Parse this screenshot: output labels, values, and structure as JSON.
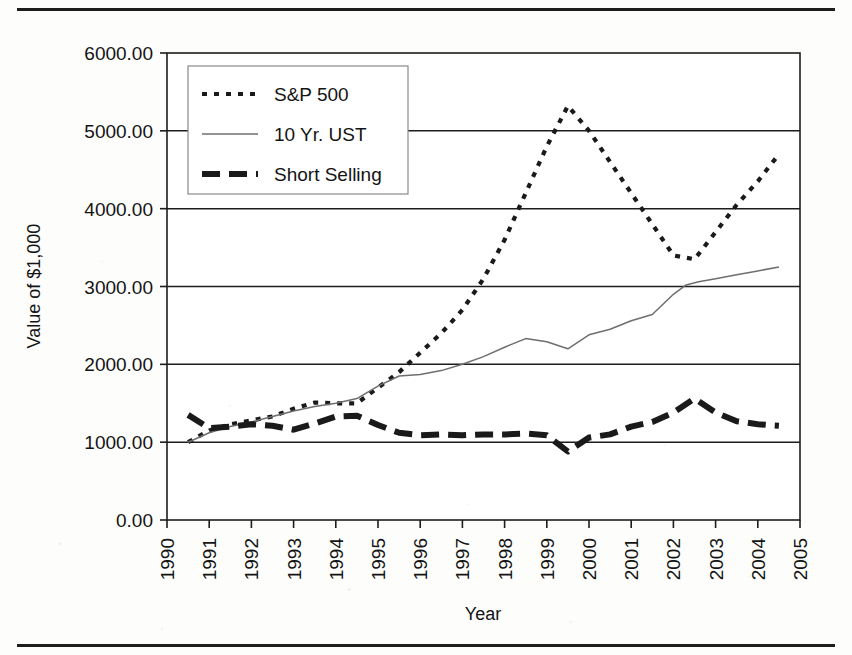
{
  "figure": {
    "top_rule": "horizontal-rule",
    "bottom_rule": "horizontal-rule"
  },
  "chart_data": {
    "type": "line",
    "title": "",
    "xlabel": "Year",
    "ylabel": "Value of $1,000",
    "xlim": [
      1990,
      2005
    ],
    "ylim": [
      0,
      6000
    ],
    "grid": "horizontal",
    "legend_position": "top-left",
    "xticks": [
      "1990",
      "1991",
      "1992",
      "1993",
      "1994",
      "1995",
      "1996",
      "1997",
      "1998",
      "1999",
      "2000",
      "2001",
      "2002",
      "2003",
      "2004",
      "2005"
    ],
    "yticks": [
      "0.00",
      "1000.00",
      "2000.00",
      "3000.00",
      "4000.00",
      "5000.00",
      "6000.00"
    ],
    "series": [
      {
        "name": "S&P 500",
        "style": "fine-dashed",
        "color": "#1a1a1a",
        "x": [
          1990.5,
          1991.0,
          1991.5,
          1992.0,
          1992.5,
          1993.0,
          1993.5,
          1994.0,
          1994.5,
          1995.0,
          1995.5,
          1996.0,
          1996.5,
          1997.0,
          1997.5,
          1998.0,
          1998.5,
          1999.0,
          1999.5,
          2000.0,
          2000.5,
          2001.0,
          2001.5,
          2002.0,
          2002.5,
          2003.0,
          2003.5,
          2004.0,
          2004.5
        ],
        "values": [
          1000,
          1150,
          1230,
          1280,
          1330,
          1430,
          1510,
          1500,
          1500,
          1700,
          1900,
          2150,
          2400,
          2700,
          3100,
          3600,
          4200,
          4800,
          5320,
          5000,
          4600,
          4200,
          3800,
          3400,
          3350,
          3700,
          4050,
          4350,
          4700
        ]
      },
      {
        "name": "10 Yr. UST",
        "style": "thin-solid",
        "color": "#6e6e6e",
        "x": [
          1990.5,
          1991.0,
          1991.5,
          1992.0,
          1992.5,
          1993.0,
          1993.5,
          1994.0,
          1994.5,
          1995.0,
          1995.5,
          1996.0,
          1996.5,
          1997.0,
          1997.5,
          1998.0,
          1998.5,
          1999.0,
          1999.5,
          2000.0,
          2000.5,
          2001.0,
          2001.5,
          2002.0,
          2002.3,
          2002.6,
          2003.0,
          2003.5,
          2004.0,
          2004.5
        ],
        "values": [
          1000,
          1120,
          1200,
          1260,
          1330,
          1400,
          1460,
          1500,
          1560,
          1720,
          1850,
          1870,
          1920,
          2000,
          2100,
          2220,
          2330,
          2290,
          2200,
          2380,
          2450,
          2560,
          2640,
          2900,
          3020,
          3060,
          3100,
          3150,
          3200,
          3250
        ]
      },
      {
        "name": "Short Selling",
        "style": "thick-dashed",
        "color": "#1a1a1a",
        "x": [
          1990.5,
          1991.0,
          1991.5,
          1992.0,
          1992.5,
          1993.0,
          1993.5,
          1994.0,
          1994.5,
          1995.0,
          1995.5,
          1996.0,
          1996.5,
          1997.0,
          1997.5,
          1998.0,
          1998.5,
          1999.0,
          1999.5,
          2000.0,
          2000.5,
          2001.0,
          2001.5,
          2002.0,
          2002.5,
          2003.0,
          2003.5,
          2004.0,
          2004.5
        ],
        "values": [
          1350,
          1180,
          1200,
          1230,
          1210,
          1160,
          1240,
          1330,
          1340,
          1220,
          1120,
          1090,
          1100,
          1090,
          1100,
          1100,
          1110,
          1090,
          880,
          1060,
          1100,
          1200,
          1260,
          1380,
          1560,
          1380,
          1270,
          1230,
          1210
        ]
      }
    ]
  }
}
